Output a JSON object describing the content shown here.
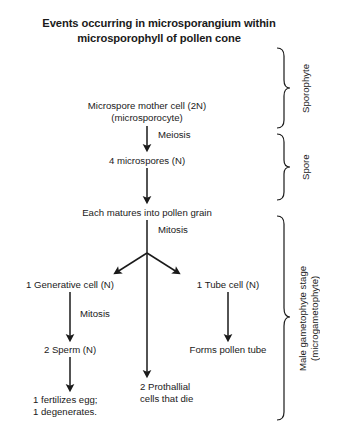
{
  "title": {
    "line1": "Events occurring in microsporangium within",
    "line2": "microsporophyll of pollen cone"
  },
  "nodes": {
    "mother_cell_line1": "Microspore mother cell (2N)",
    "mother_cell_line2": "(microsporocyte)",
    "microspores": "4 microspores (N)",
    "pollen_grain": "Each matures into pollen grain",
    "generative_cell": "1 Generative cell (N)",
    "tube_cell": "1 Tube cell (N)",
    "sperm": "2 Sperm (N)",
    "pollen_tube": "Forms pollen tube",
    "prothallial_line1": "2 Prothallial",
    "prothallial_line2": "cells that die",
    "fertilizes_line1": "1 fertilizes egg;",
    "fertilizes_line2": "1 degenerates."
  },
  "process_labels": {
    "meiosis": "Meiosis",
    "mitosis_top": "Mitosis",
    "mitosis_left": "Mitosis"
  },
  "braces": {
    "sporophyte": "Sporophyte",
    "spore": "Spore",
    "gametophyte_line1": "Male gametophyte stage",
    "gametophyte_line2": "(microgametophyte)"
  },
  "colors": {
    "ink": "#1a1a1a",
    "background": "#ffffff"
  }
}
